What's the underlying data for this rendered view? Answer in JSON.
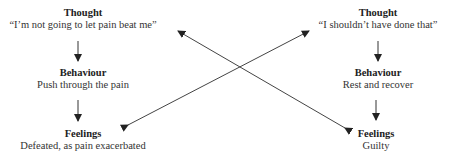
{
  "left": {
    "thought": {
      "heading": "Thought",
      "text": "“I’m not going to let pain beat me”"
    },
    "behaviour": {
      "heading": "Behaviour",
      "text": "Push through the pain"
    },
    "feelings": {
      "heading": "Feelings",
      "text": "Defeated, as pain exacerbated"
    }
  },
  "right": {
    "thought": {
      "heading": "Thought",
      "text": "“I shouldn’t have done that”"
    },
    "behaviour": {
      "heading": "Behaviour",
      "text": "Rest and recover"
    },
    "feelings": {
      "heading": "Feelings",
      "text": "Guilty"
    }
  },
  "colors": {
    "line": "#333333",
    "text": "#222222"
  }
}
